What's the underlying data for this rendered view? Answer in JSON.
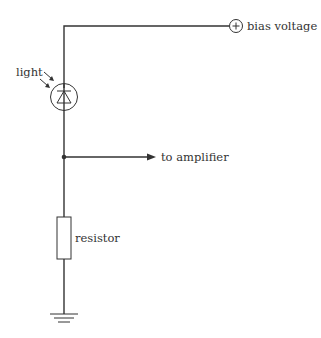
{
  "diagram": {
    "labels": {
      "bias": "bias voltage",
      "light": "light",
      "output": "to amplifier",
      "resistor": "resistor"
    },
    "symbols": {
      "bias_terminal": "+",
      "photodiode": "photodiode",
      "resistor": "resistor",
      "ground": "ground"
    },
    "colors": {
      "line": "#333333",
      "background": "#ffffff"
    }
  }
}
